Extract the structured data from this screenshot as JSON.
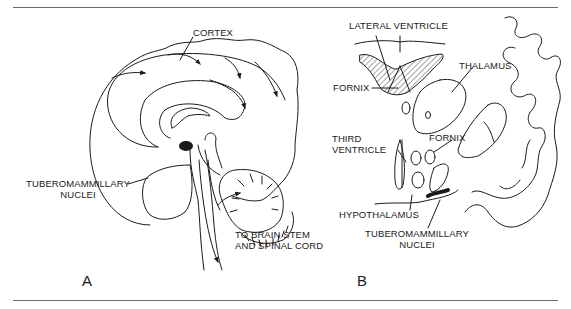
{
  "figure": {
    "panel_a": {
      "letter": "A",
      "labels": {
        "cortex": "CORTEX",
        "tmn_line1": "TUBEROMAMMILLARY",
        "tmn_line2": "NUCLEI",
        "brainstem_line1": "TO BRAIN STEM",
        "brainstem_line2": "AND SPINAL CORD"
      }
    },
    "panel_b": {
      "letter": "B",
      "labels": {
        "lateral_ventricle": "LATERAL VENTRICLE",
        "fornix_top": "FORNIX",
        "thalamus": "THALAMUS",
        "third_ventricle_line1": "THIRD",
        "third_ventricle_line2": "VENTRICLE",
        "fornix_mid": "FORNIX",
        "hypothalamus": "HYPOTHALAMUS",
        "tmn_line1": "TUBEROMAMMILLARY",
        "tmn_line2": "NUCLEI"
      }
    },
    "colors": {
      "ink": "#1a1a1a",
      "rule": "#6b6b6b",
      "background": "#ffffff"
    }
  }
}
